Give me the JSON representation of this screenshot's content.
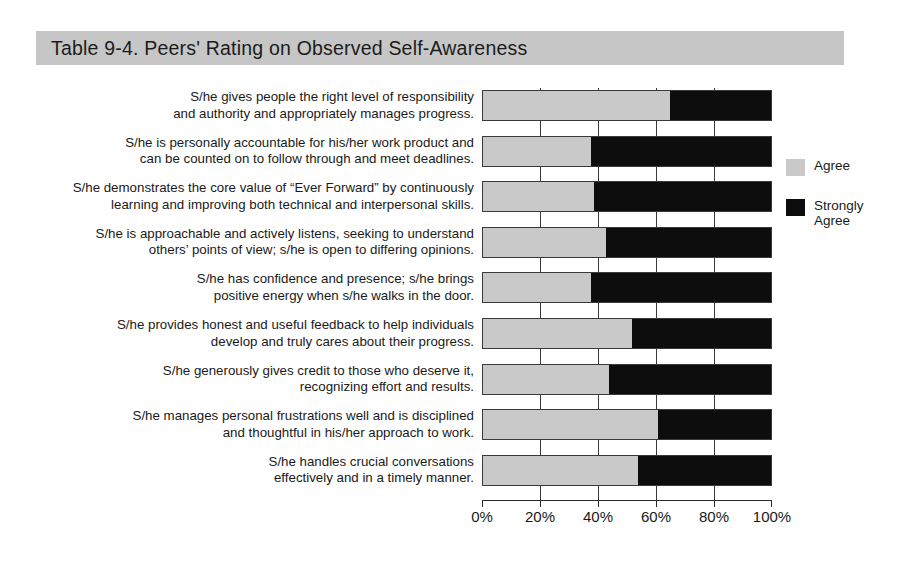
{
  "title": {
    "text": "Table 9-4. Peers' Rating on Observed Self-Awareness"
  },
  "legend": {
    "position": "right",
    "entries": [
      {
        "label": "Agree",
        "color": "#c9c9c9",
        "swatch": "legend-swatch-agree"
      },
      {
        "label": "Strongly Agree",
        "color": "#0d0d0d",
        "swatch": "legend-swatch-strongly"
      }
    ]
  },
  "axis": {
    "ticks": [
      "0%",
      "20%",
      "40%",
      "60%",
      "80%",
      "100%"
    ],
    "min": 0,
    "max": 100
  },
  "rows": [
    {
      "line1": "S/he gives people the right level of responsibility",
      "line2": "and authority and appropriately manages progress.",
      "agree": 65,
      "strongly": 35
    },
    {
      "line1": "S/he is personally accountable for his/her work product and",
      "line2": "can be counted on to follow through and meet deadlines.",
      "agree": 38,
      "strongly": 62
    },
    {
      "line1": "S/he demonstrates the core value of “Ever Forward” by continuously",
      "line2": "learning and improving both technical and interpersonal skills.",
      "agree": 39,
      "strongly": 61
    },
    {
      "line1": "S/he is approachable and actively listens, seeking to understand",
      "line2": "others’ points of view; s/he is open to differing opinions.",
      "agree": 43,
      "strongly": 57
    },
    {
      "line1": "S/he has confidence and presence; s/he brings",
      "line2": "positive energy when s/he walks in the door.",
      "agree": 38,
      "strongly": 62
    },
    {
      "line1": "S/he provides honest and useful feedback to help individuals",
      "line2": "develop and truly cares about their progress.",
      "agree": 52,
      "strongly": 48
    },
    {
      "line1": "S/he generously gives credit to those who deserve it,",
      "line2": "recognizing effort and results.",
      "agree": 44,
      "strongly": 56
    },
    {
      "line1": "S/he manages personal frustrations well and is disciplined",
      "line2": "and thoughtful in his/her approach to work.",
      "agree": 61,
      "strongly": 39
    },
    {
      "line1": "S/he handles crucial conversations",
      "line2": "effectively and in a timely manner.",
      "agree": 54,
      "strongly": 46
    }
  ],
  "chart_data": {
    "type": "bar",
    "orientation": "horizontal",
    "stacked": true,
    "percent_stacked": true,
    "title": "Table 9-4. Peers' Rating on Observed Self-Awareness",
    "xlabel": "",
    "ylabel": "",
    "xlim": [
      0,
      100
    ],
    "xticks": [
      0,
      20,
      40,
      60,
      80,
      100
    ],
    "xtick_labels": [
      "0%",
      "20%",
      "40%",
      "60%",
      "80%",
      "100%"
    ],
    "grid": true,
    "legend_position": "right",
    "categories": [
      "S/he gives people the right level of responsibility and authority and appropriately manages progress.",
      "S/he is personally accountable for his/her work product and can be counted on to follow through and meet deadlines.",
      "S/he demonstrates the core value of “Ever Forward” by continuously learning and improving both technical and interpersonal skills.",
      "S/he is approachable and actively listens, seeking to understand others’ points of view; s/he is open to differing opinions.",
      "S/he has confidence and presence; s/he brings positive energy when s/he walks in the door.",
      "S/he provides honest and useful feedback to help individuals develop and truly cares about their progress.",
      "S/he generously gives credit to those who deserve it, recognizing effort and results.",
      "S/he manages personal frustrations well and is disciplined and thoughtful in his/her approach to work.",
      "S/he handles crucial conversations effectively and in a timely manner."
    ],
    "series": [
      {
        "name": "Agree",
        "color": "#c9c9c9",
        "values": [
          65,
          38,
          39,
          43,
          38,
          52,
          44,
          61,
          54
        ]
      },
      {
        "name": "Strongly Agree",
        "color": "#0d0d0d",
        "values": [
          35,
          62,
          61,
          57,
          62,
          48,
          56,
          39,
          46
        ]
      }
    ]
  }
}
